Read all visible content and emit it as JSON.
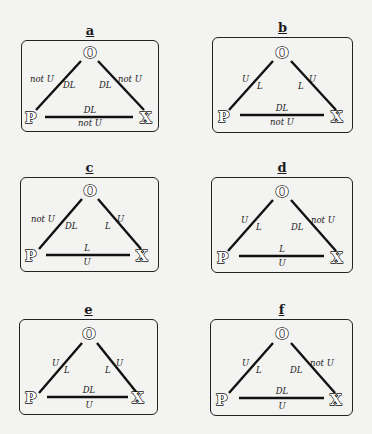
{
  "nodes": {
    "top": "O",
    "left": "P",
    "right": "X"
  },
  "panels": [
    {
      "id": "a",
      "title": "a",
      "po": {
        "outer": "not U",
        "inner": "DL"
      },
      "ox": {
        "inner": "DL",
        "outer": "not U"
      },
      "px": {
        "above": "DL",
        "below": "not U"
      }
    },
    {
      "id": "b",
      "title": "b",
      "po": {
        "outer": "U",
        "inner": "L"
      },
      "ox": {
        "inner": "L",
        "outer": "U"
      },
      "px": {
        "above": "DL",
        "below": "not U"
      }
    },
    {
      "id": "c",
      "title": "c",
      "po": {
        "outer": "not U",
        "inner": "DL"
      },
      "ox": {
        "inner": "L",
        "outer": "U"
      },
      "px": {
        "above": "L",
        "below": "U"
      }
    },
    {
      "id": "d",
      "title": "d",
      "po": {
        "outer": "U",
        "inner": "L"
      },
      "ox": {
        "inner": "DL",
        "outer": "not U"
      },
      "px": {
        "above": "L",
        "below": "U"
      }
    },
    {
      "id": "e",
      "title": "e",
      "po": {
        "outer": "U",
        "inner": "L"
      },
      "ox": {
        "inner": "L",
        "outer": "U"
      },
      "px": {
        "above": "DL",
        "below": "U"
      }
    },
    {
      "id": "f",
      "title": "f",
      "po": {
        "outer": "U",
        "inner": "L"
      },
      "ox": {
        "inner": "DL",
        "outer": "not U"
      },
      "px": {
        "above": "DL",
        "below": "U"
      }
    }
  ]
}
